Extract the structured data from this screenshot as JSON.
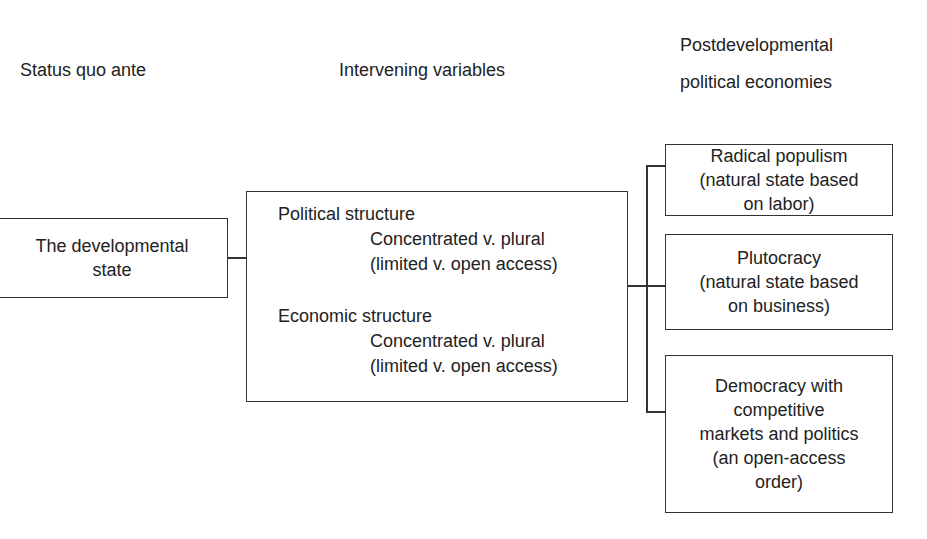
{
  "headings": {
    "status_quo": "Status quo ante",
    "intervening": "Intervening variables",
    "post_line1": "Postdevelopmental",
    "post_line2": "political economies"
  },
  "left_box": {
    "line1": "The developmental",
    "line2": "state"
  },
  "middle_box": {
    "political": {
      "title": "Political structure",
      "line1": "Concentrated v. plural",
      "line2": "(limited v. open access)"
    },
    "economic": {
      "title": "Economic structure",
      "line1": "Concentrated v. plural",
      "line2": "(limited v. open access)"
    }
  },
  "outcomes": [
    {
      "lines": [
        "Radical populism",
        "(natural state based",
        "on labor)"
      ]
    },
    {
      "lines": [
        "Plutocracy",
        "(natural state based",
        "on business)"
      ]
    },
    {
      "lines": [
        "Democracy with",
        "competitive",
        "markets and politics",
        "(an open-access",
        "order)"
      ]
    }
  ],
  "colors": {
    "line": "#333333",
    "text": "#222222",
    "background": "#ffffff"
  }
}
